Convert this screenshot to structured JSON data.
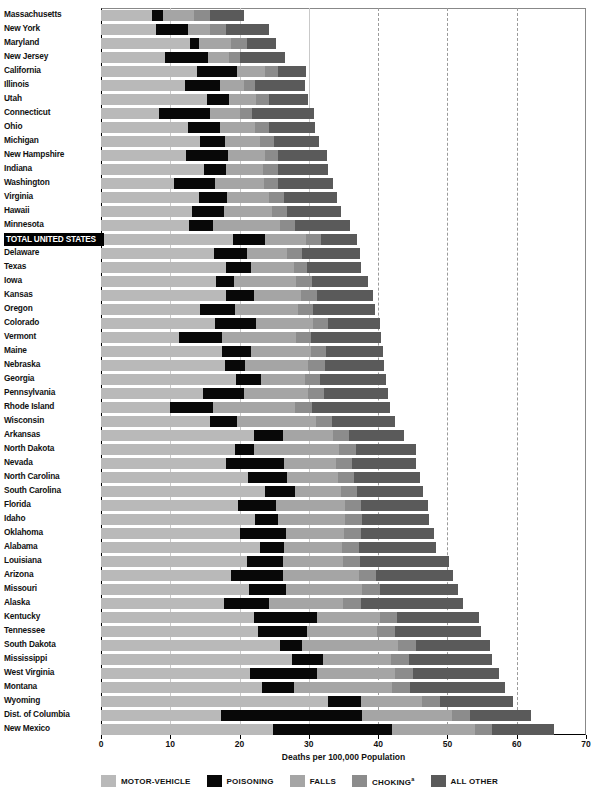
{
  "chart_data": {
    "type": "bar",
    "orientation": "horizontal",
    "stacked": true,
    "title": "",
    "xlabel": "Deaths per 100,000 Population",
    "ylabel": "",
    "xlim": [
      0,
      70
    ],
    "xticks": [
      0,
      10,
      20,
      30,
      40,
      50,
      60,
      70
    ],
    "grid": true,
    "legend_position": "bottom",
    "series": [
      {
        "name": "MOTOR-VEHICLE",
        "color": "#b9b9b9"
      },
      {
        "name": "POISONING",
        "color": "#080808"
      },
      {
        "name": "FALLS",
        "color": "#a5a5a5"
      },
      {
        "name": "CHOKING",
        "color": "#8c8c8c"
      },
      {
        "name": "ALL OTHER",
        "color": "#5a5a5a"
      }
    ],
    "categories": [
      "Massachusetts",
      "New York",
      "Maryland",
      "New Jersey",
      "California",
      "Illinois",
      "Utah",
      "Connecticut",
      "Ohio",
      "Michigan",
      "New Hampshire",
      "Indiana",
      "Washington",
      "Virginia",
      "Hawaii",
      "Minnesota",
      "TOTAL UNITED STATES",
      "Delaware",
      "Texas",
      "Iowa",
      "Kansas",
      "Oregon",
      "Colorado",
      "Vermont",
      "Maine",
      "Nebraska",
      "Georgia",
      "Pennsylvania",
      "Rhode Island",
      "Wisconsin",
      "Arkansas",
      "North Dakota",
      "Nevada",
      "North Carolina",
      "South Carolina",
      "Florida",
      "Idaho",
      "Oklahoma",
      "Alabama",
      "Louisiana",
      "Arizona",
      "Missouri",
      "Alaska",
      "Kentucky",
      "Tennessee",
      "South Dakota",
      "Mississippi",
      "West Virginia",
      "Montana",
      "Wyoming",
      "Dist. of Columbia",
      "New Mexico"
    ],
    "highlight_category": "TOTAL UNITED STATES",
    "rows": [
      {
        "state": "Massachusetts",
        "values": [
          7.4,
          1.6,
          4.4,
          2.3,
          4.9
        ],
        "total": 20.6
      },
      {
        "state": "New York",
        "values": [
          8.0,
          4.6,
          3.2,
          2.2,
          6.2
        ],
        "total": 24.2
      },
      {
        "state": "Maryland",
        "values": [
          12.9,
          1.3,
          4.6,
          2.3,
          4.2
        ],
        "total": 25.3
      },
      {
        "state": "New Jersey",
        "values": [
          9.2,
          6.3,
          3.0,
          1.6,
          6.4
        ],
        "total": 26.5
      },
      {
        "state": "California",
        "values": [
          13.8,
          5.9,
          3.9,
          2.0,
          4.0
        ],
        "total": 29.6
      },
      {
        "state": "Illinois",
        "values": [
          12.1,
          5.1,
          3.4,
          1.6,
          7.2
        ],
        "total": 29.4
      },
      {
        "state": "Utah",
        "values": [
          15.3,
          3.2,
          3.9,
          1.9,
          5.6
        ],
        "total": 29.9
      },
      {
        "state": "Connecticut",
        "values": [
          8.4,
          7.4,
          4.2,
          1.8,
          8.9
        ],
        "total": 30.7
      },
      {
        "state": "Ohio",
        "values": [
          12.6,
          4.6,
          5.1,
          2.0,
          6.6
        ],
        "total": 30.9
      },
      {
        "state": "Michigan",
        "values": [
          14.3,
          3.6,
          5.0,
          2.0,
          6.6
        ],
        "total": 31.5
      },
      {
        "state": "New Hampshire",
        "values": [
          12.3,
          6.1,
          5.3,
          1.8,
          7.1
        ],
        "total": 32.6
      },
      {
        "state": "Indiana",
        "values": [
          14.8,
          3.2,
          5.4,
          2.1,
          7.2
        ],
        "total": 32.7
      },
      {
        "state": "Washington",
        "values": [
          10.6,
          5.9,
          7.0,
          2.1,
          7.9
        ],
        "total": 33.5
      },
      {
        "state": "Virginia",
        "values": [
          14.2,
          4.0,
          6.1,
          2.1,
          7.6
        ],
        "total": 34.0
      },
      {
        "state": "Hawaii",
        "values": [
          13.2,
          4.5,
          7.0,
          2.2,
          7.8
        ],
        "total": 34.7
      },
      {
        "state": "Minnesota",
        "values": [
          12.7,
          3.4,
          9.7,
          2.2,
          8.0
        ],
        "total": 36.0
      },
      {
        "state": "TOTAL UNITED STATES",
        "values": [
          19.0,
          4.7,
          5.9,
          2.2,
          5.1
        ],
        "total": 36.9
      },
      {
        "state": "Delaware",
        "values": [
          16.3,
          4.8,
          5.8,
          2.1,
          8.4
        ],
        "total": 37.4
      },
      {
        "state": "Texas",
        "values": [
          18.0,
          3.6,
          6.2,
          2.0,
          7.7
        ],
        "total": 37.5
      },
      {
        "state": "Iowa",
        "values": [
          16.6,
          2.6,
          8.9,
          2.3,
          8.1
        ],
        "total": 38.5
      },
      {
        "state": "Kansas",
        "values": [
          18.1,
          4.0,
          6.8,
          2.3,
          8.0
        ],
        "total": 39.2
      },
      {
        "state": "Oregon",
        "values": [
          14.3,
          5.0,
          9.1,
          2.2,
          9.0
        ],
        "total": 39.6
      },
      {
        "state": "Colorado",
        "values": [
          16.5,
          5.9,
          8.2,
          2.1,
          7.5
        ],
        "total": 40.2
      },
      {
        "state": "Vermont",
        "values": [
          11.2,
          6.3,
          10.6,
          2.2,
          10.1
        ],
        "total": 40.4
      },
      {
        "state": "Maine",
        "values": [
          17.4,
          4.3,
          8.6,
          2.2,
          8.2
        ],
        "total": 40.7
      },
      {
        "state": "Nebraska",
        "values": [
          17.9,
          2.9,
          9.1,
          2.4,
          8.6
        ],
        "total": 40.9
      },
      {
        "state": "Georgia",
        "values": [
          19.5,
          3.6,
          6.3,
          2.2,
          9.5
        ],
        "total": 41.1
      },
      {
        "state": "Pennsylvania",
        "values": [
          14.7,
          6.0,
          9.2,
          2.3,
          9.2
        ],
        "total": 41.4
      },
      {
        "state": "Rhode Island",
        "values": [
          9.9,
          6.3,
          11.8,
          2.4,
          11.3
        ],
        "total": 41.7
      },
      {
        "state": "Wisconsin",
        "values": [
          15.8,
          3.8,
          11.4,
          2.4,
          9.0
        ],
        "total": 42.4
      },
      {
        "state": "Arkansas",
        "values": [
          22.1,
          4.2,
          7.2,
          2.3,
          7.9
        ],
        "total": 43.7
      },
      {
        "state": "North Dakota",
        "values": [
          19.3,
          2.8,
          12.2,
          2.5,
          8.6
        ],
        "total": 45.4
      },
      {
        "state": "Nevada",
        "values": [
          18.1,
          8.3,
          7.5,
          2.3,
          9.3
        ],
        "total": 45.5
      },
      {
        "state": "North Carolina",
        "values": [
          21.2,
          5.6,
          7.4,
          2.3,
          9.6
        ],
        "total": 46.1
      },
      {
        "state": "South Carolina",
        "values": [
          23.6,
          4.4,
          6.6,
          2.3,
          9.6
        ],
        "total": 46.5
      },
      {
        "state": "Florida",
        "values": [
          19.8,
          5.4,
          10.0,
          2.4,
          9.6
        ],
        "total": 47.2
      },
      {
        "state": "Idaho",
        "values": [
          22.2,
          3.3,
          9.7,
          2.5,
          9.7
        ],
        "total": 47.4
      },
      {
        "state": "Oklahoma",
        "values": [
          20.0,
          6.7,
          8.4,
          2.4,
          10.6
        ],
        "total": 48.1
      },
      {
        "state": "Alabama",
        "values": [
          23.0,
          3.4,
          8.4,
          2.5,
          11.1
        ],
        "total": 48.4
      },
      {
        "state": "Louisiana",
        "values": [
          21.1,
          5.2,
          8.6,
          2.5,
          12.8
        ],
        "total": 50.2
      },
      {
        "state": "Arizona",
        "values": [
          18.8,
          7.4,
          11.0,
          2.5,
          11.1
        ],
        "total": 50.8
      },
      {
        "state": "Missouri",
        "values": [
          21.4,
          5.3,
          11.0,
          2.5,
          11.4
        ],
        "total": 51.6
      },
      {
        "state": "Alaska",
        "values": [
          17.7,
          6.5,
          10.8,
          2.5,
          14.8
        ],
        "total": 52.3
      },
      {
        "state": "Kentucky",
        "values": [
          22.1,
          9.1,
          9.0,
          2.5,
          11.9
        ],
        "total": 54.6
      },
      {
        "state": "Tennessee",
        "values": [
          22.7,
          7.0,
          10.2,
          2.5,
          12.5
        ],
        "total": 54.9
      },
      {
        "state": "South Dakota",
        "values": [
          25.8,
          3.2,
          13.9,
          2.6,
          10.7
        ],
        "total": 56.2
      },
      {
        "state": "Mississippi",
        "values": [
          27.6,
          4.4,
          9.9,
          2.6,
          12.0
        ],
        "total": 56.5
      },
      {
        "state": "West Virginia",
        "values": [
          21.5,
          9.7,
          11.2,
          2.6,
          12.5
        ],
        "total": 57.5
      },
      {
        "state": "Montana",
        "values": [
          23.3,
          4.5,
          14.2,
          2.6,
          13.7
        ],
        "total": 58.3
      },
      {
        "state": "Wyoming",
        "values": [
          32.8,
          4.7,
          8.9,
          2.6,
          10.4
        ],
        "total": 59.4
      },
      {
        "state": "Dist. of Columbia",
        "values": [
          17.3,
          20.3,
          13.1,
          2.6,
          8.7
        ],
        "total": 62.0
      },
      {
        "state": "New Mexico",
        "values": [
          24.8,
          17.2,
          12.0,
          2.5,
          8.9
        ],
        "total": 65.4
      }
    ]
  },
  "legend": {
    "items": [
      {
        "label": "MOTOR-VEHICLE",
        "color": "#b9b9b9",
        "superscript": ""
      },
      {
        "label": "POISONING",
        "color": "#080808",
        "superscript": ""
      },
      {
        "label": "FALLS",
        "color": "#a5a5a5",
        "superscript": ""
      },
      {
        "label": "CHOKING",
        "color": "#8c8c8c",
        "superscript": "a"
      },
      {
        "label": "ALL OTHER",
        "color": "#5a5a5a",
        "superscript": ""
      }
    ]
  },
  "axis": {
    "xlabel": "Deaths per 100,000 Population",
    "ticks": [
      "0",
      "10",
      "20",
      "30",
      "40",
      "50",
      "60",
      "70"
    ]
  }
}
